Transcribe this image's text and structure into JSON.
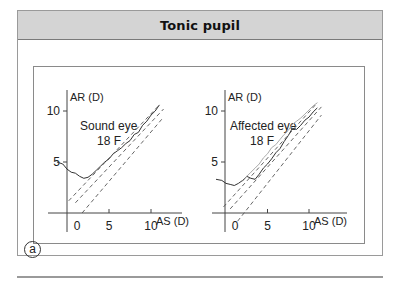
{
  "header": {
    "title": "Tonic pupil"
  },
  "figure_label": "a",
  "chart_data": [
    {
      "type": "line",
      "title": "Sound eye",
      "subtitle": "18 F",
      "xlabel": "AS (D)",
      "ylabel": "AR (D)",
      "xticks": [
        "0",
        "5",
        "10"
      ],
      "yticks": [
        "5",
        "10"
      ],
      "xlim": [
        -0.5,
        13.5
      ],
      "ylim": [
        -1.5,
        12
      ],
      "series": [
        {
          "name": "response",
          "style": "solid",
          "x": [
            -1.2,
            -0.5,
            0,
            0.5,
            1,
            1.5,
            2,
            2.5,
            3,
            3.5,
            4,
            4.5,
            5,
            5.5,
            6,
            6.5,
            7,
            7.5,
            8,
            8.5,
            9,
            9.5,
            10,
            10.5,
            11
          ],
          "y": [
            5,
            4.8,
            4.3,
            4.0,
            3.9,
            3.6,
            3.4,
            3.5,
            3.8,
            4.2,
            4.6,
            5.0,
            5.3,
            5.8,
            6.1,
            6.4,
            6.8,
            7.1,
            7.7,
            7.9,
            8.6,
            9.0,
            9.6,
            10.0,
            10.6
          ]
        },
        {
          "name": "upper-limit",
          "style": "dashed",
          "x": [
            0.2,
            11
          ],
          "y": [
            1.2,
            10.6
          ]
        },
        {
          "name": "mid-line",
          "style": "dashed",
          "x": [
            1.0,
            11.5
          ],
          "y": [
            1.0,
            10.2
          ]
        },
        {
          "name": "lower-limit",
          "style": "dashed",
          "x": [
            1.8,
            11.5
          ],
          "y": [
            0.0,
            9.4
          ]
        }
      ]
    },
    {
      "type": "line",
      "title": "Affected eye",
      "subtitle": "18 F",
      "xlabel": "AS (D)",
      "ylabel": "AR (D)",
      "xticks": [
        "0",
        "5",
        "10"
      ],
      "yticks": [
        "5",
        "10"
      ],
      "xlim": [
        -0.5,
        13.5
      ],
      "ylim": [
        -1.5,
        12
      ],
      "series": [
        {
          "name": "response-dark",
          "style": "solid",
          "x": [
            -1.2,
            -0.5,
            0,
            0.5,
            1,
            1.5,
            2,
            2.5,
            3,
            3.5,
            4,
            4.5,
            5,
            5.5,
            6,
            6.5,
            7,
            7.5,
            8,
            8.5,
            9,
            9.5,
            10,
            10.5,
            11
          ],
          "y": [
            3.3,
            3.2,
            2.9,
            2.8,
            2.7,
            2.9,
            3.2,
            3.6,
            3.4,
            3.3,
            3.8,
            4.4,
            4.8,
            5.3,
            5.9,
            6.3,
            7.0,
            7.6,
            8.3,
            8.2,
            8.6,
            9.1,
            9.4,
            9.9,
            10.3
          ]
        },
        {
          "name": "response-light",
          "style": "solid-light",
          "x": [
            2,
            2.5,
            3,
            3.5,
            4,
            4.5,
            5,
            5.5,
            6,
            6.5,
            7,
            7.5,
            8,
            8.5,
            9,
            9.5,
            10,
            10.5,
            11
          ],
          "y": [
            3.1,
            3.6,
            4.0,
            4.4,
            4.8,
            5.4,
            5.8,
            6.4,
            6.7,
            7.2,
            7.7,
            8.1,
            8.7,
            9.0,
            9.3,
            9.7,
            10.1,
            10.5,
            10.8
          ]
        },
        {
          "name": "upper-limit",
          "style": "dashed",
          "x": [
            -0.3,
            11
          ],
          "y": [
            0.6,
            10.8
          ]
        },
        {
          "name": "mid-line",
          "style": "dashed",
          "x": [
            0.5,
            11.5
          ],
          "y": [
            0.4,
            10.4
          ]
        },
        {
          "name": "lower-limit",
          "style": "dashed",
          "x": [
            1.4,
            11.5
          ],
          "y": [
            -0.8,
            9.6
          ]
        }
      ]
    }
  ]
}
